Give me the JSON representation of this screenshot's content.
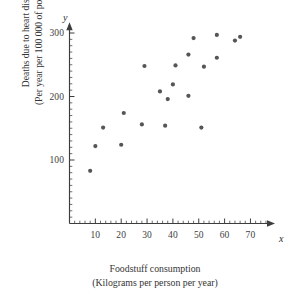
{
  "figure": {
    "background_color": "#ffffff",
    "ink_color": "#3d3d3d",
    "marker_color": "#555555"
  },
  "axes": {
    "x_variable_symbol": "x",
    "y_variable_symbol": "y",
    "x_title_line1": "Foodstuff consumption",
    "x_title_line2": "(Kilograms per person per year)",
    "y_title_line1": "Deaths due to heart disease",
    "y_title_line2": "(Per year per 100 000 of population)",
    "x_tick_labels": [
      "10",
      "20",
      "30",
      "40",
      "50",
      "60",
      "70"
    ],
    "y_tick_labels": [
      "100",
      "200",
      "300"
    ]
  },
  "chart_data": {
    "type": "scatter",
    "title": "",
    "xlabel": "Foodstuff consumption (Kilograms per person per year)",
    "ylabel": "Deaths due to heart disease (Per year per 100 000 of population)",
    "xlim": [
      0,
      78
    ],
    "ylim": [
      0,
      320
    ],
    "xticks": [
      10,
      20,
      30,
      40,
      50,
      60,
      70
    ],
    "yticks": [
      100,
      200,
      300
    ],
    "x_minor_tick_step": 2,
    "y_minor_tick_step": 10,
    "grid": false,
    "legend": null,
    "n_points": 21,
    "points": [
      {
        "x": 8,
        "y": 83
      },
      {
        "x": 10,
        "y": 122
      },
      {
        "x": 13,
        "y": 151
      },
      {
        "x": 20,
        "y": 124
      },
      {
        "x": 21,
        "y": 174
      },
      {
        "x": 28,
        "y": 156
      },
      {
        "x": 29,
        "y": 248
      },
      {
        "x": 35,
        "y": 208
      },
      {
        "x": 37,
        "y": 154
      },
      {
        "x": 38,
        "y": 196
      },
      {
        "x": 40,
        "y": 219
      },
      {
        "x": 41,
        "y": 249
      },
      {
        "x": 46,
        "y": 201
      },
      {
        "x": 46,
        "y": 266
      },
      {
        "x": 48,
        "y": 292
      },
      {
        "x": 51,
        "y": 151
      },
      {
        "x": 52,
        "y": 247
      },
      {
        "x": 57,
        "y": 261
      },
      {
        "x": 57,
        "y": 297
      },
      {
        "x": 64,
        "y": 288
      },
      {
        "x": 66,
        "y": 294
      }
    ]
  }
}
